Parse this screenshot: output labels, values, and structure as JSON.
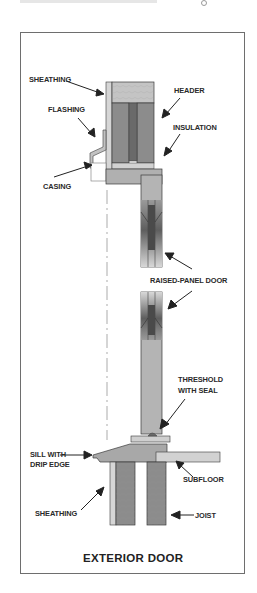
{
  "diagram": {
    "title": "EXTERIOR DOOR",
    "labels": {
      "sheathing_top": "SHEATHING",
      "flashing": "FLASHING",
      "casing": "CASING",
      "header": "HEADER",
      "insulation": "INSULATION",
      "raised_panel_door": "RAISED-PANEL DOOR",
      "threshold_line1": "THRESHOLD",
      "threshold_line2": "WITH SEAL",
      "sill_line1": "SILL WITH",
      "sill_line2": "DRIP EDGE",
      "subfloor": "SUBFLOOR",
      "sheathing_bottom": "SHEATHING",
      "joist": "JOIST"
    },
    "colors": {
      "wood_dark": "#8c8c8c",
      "wood_mid": "#a9a9a9",
      "wood_light": "#c8c8c8",
      "sheathing": "#d6d6d6",
      "outline": "#3a3a3a",
      "text": "#2a2a2a"
    }
  }
}
